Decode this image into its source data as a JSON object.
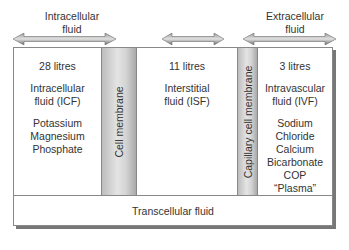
{
  "headers": {
    "intracellular": [
      "Intracellular",
      "fluid"
    ],
    "extracellular": [
      "Extracellular",
      "fluid"
    ]
  },
  "compartments": [
    {
      "volume": "28 litres",
      "name": [
        "Intracellular",
        "fluid (ICF)"
      ],
      "solutes": [
        "Potassium",
        "Magnesium",
        "Phosphate"
      ]
    },
    {
      "volume": "11 litres",
      "name": [
        "Interstitial",
        "fluid (ISF)"
      ],
      "solutes": []
    },
    {
      "volume": "3 litres",
      "name": [
        "Intravascular",
        "fluid (IVF)"
      ],
      "solutes": [
        "Sodium",
        "Chloride",
        "Calcium",
        "Bicarbonate",
        "COP",
        "“Plasma”"
      ]
    }
  ],
  "membranes": [
    "Cell membrane",
    "Capillary cell membrane"
  ],
  "transcellular": "Transcellular fluid",
  "colors": {
    "arrow": "#7a7a7a",
    "membrane": "#c8c8c8",
    "border": "#888888"
  }
}
